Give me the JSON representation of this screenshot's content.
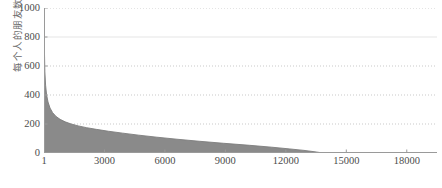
{
  "chart_data": {
    "type": "area",
    "title": "",
    "xlabel": "",
    "ylabel": "每个人的朋友数",
    "xlim": [
      1,
      19500
    ],
    "ylim": [
      0,
      1000
    ],
    "grid": true,
    "legend": "none",
    "fill_color": "#8a8a8a",
    "line_color": "#7d7d7d",
    "axis_color": "#9a9a9a",
    "grid_color": "#b9b9b9",
    "x_ticks": [
      {
        "value": 1,
        "label": "1"
      },
      {
        "value": 3000,
        "label": "3000"
      },
      {
        "value": 6000,
        "label": "6000"
      },
      {
        "value": 9000,
        "label": "9000"
      },
      {
        "value": 12000,
        "label": "12000"
      },
      {
        "value": 15000,
        "label": "15000"
      },
      {
        "value": 18000,
        "label": "18000"
      }
    ],
    "y_ticks": [
      {
        "value": 0,
        "label": "0"
      },
      {
        "value": 200,
        "label": "200"
      },
      {
        "value": 400,
        "label": "400"
      },
      {
        "value": 600,
        "label": "600"
      },
      {
        "value": 800,
        "label": "800"
      },
      {
        "value": 1000,
        "label": "1000"
      }
    ],
    "x": [
      1,
      20,
      45,
      80,
      130,
      200,
      300,
      430,
      600,
      800,
      1050,
      1350,
      1700,
      2100,
      2600,
      3200,
      3900,
      4700,
      5600,
      6600,
      7700,
      8900,
      10200,
      11300,
      12200,
      12900,
      13350,
      13600,
      13750,
      13800
    ],
    "values": [
      985,
      720,
      560,
      468,
      402,
      352,
      310,
      278,
      252,
      232,
      215,
      200,
      187,
      175,
      163,
      150,
      137,
      123,
      109,
      95,
      81,
      67,
      53,
      40,
      28,
      18,
      10,
      5,
      2,
      0
    ]
  }
}
